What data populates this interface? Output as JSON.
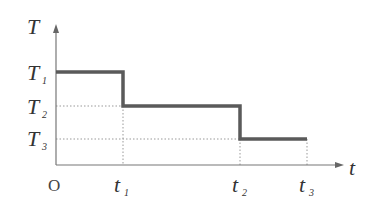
{
  "diagram": {
    "axes": {
      "y_label": "T",
      "x_label": "t",
      "origin_label": "O"
    },
    "y_ticks": [
      {
        "main": "T",
        "sub": "1"
      },
      {
        "main": "T",
        "sub": "2"
      },
      {
        "main": "T",
        "sub": "3"
      }
    ],
    "x_ticks": [
      {
        "main": "t",
        "sub": "1"
      },
      {
        "main": "t",
        "sub": "2"
      },
      {
        "main": "t",
        "sub": "3"
      }
    ],
    "segments": [
      {
        "from": "O",
        "to": "t1",
        "level": "T1"
      },
      {
        "from": "t1",
        "to": "t2",
        "level": "T2"
      },
      {
        "from": "t2",
        "to": "t3",
        "level": "T3"
      }
    ],
    "colors": {
      "step_line": "#555555",
      "axis": "#777777",
      "guide": "#888888"
    }
  }
}
